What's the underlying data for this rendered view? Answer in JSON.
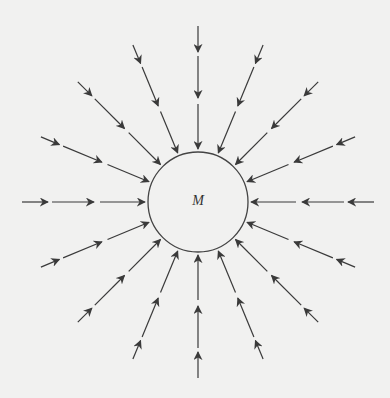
{
  "diagram": {
    "title": "",
    "mass": {
      "label": "M",
      "center": [
        198,
        202
      ],
      "radius": 50
    },
    "field_lines": {
      "count": 16,
      "angle_step_deg": 22.5,
      "direction": "inward",
      "segments_per_line": 3,
      "segments_r": [
        [
          176,
          150
        ],
        [
          146,
          104
        ],
        [
          98,
          53
        ]
      ],
      "outer_radius_diagonal": 170
    },
    "colors": {
      "background": "#f1f1f0",
      "line": "#3a3a3a",
      "circle": "#444444"
    }
  }
}
